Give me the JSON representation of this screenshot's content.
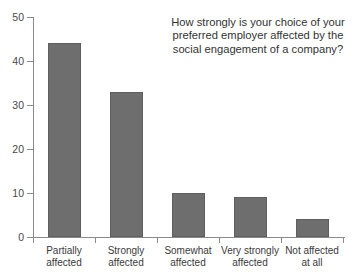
{
  "chart_data": {
    "type": "bar",
    "title": "",
    "subtitle": "",
    "annotation": "How strongly is your choice of your preferred employer affected by the social engagement of a company?",
    "categories": [
      "Partially affected",
      "Strongly affected",
      "Somewhat affected",
      "Very strongly affected",
      "Not affected at all"
    ],
    "category_lines": [
      [
        "Partially",
        "affected"
      ],
      [
        "Strongly",
        "affected"
      ],
      [
        "Somewhat",
        "affected"
      ],
      [
        "Very strongly",
        "affected"
      ],
      [
        "Not affected",
        "at all"
      ]
    ],
    "values": [
      44,
      33,
      10,
      9,
      4
    ],
    "xlabel": "",
    "ylabel": "",
    "ylim": [
      0,
      50
    ],
    "yticks": [
      0,
      10,
      20,
      30,
      40,
      50
    ],
    "ytick_labels": [
      "0",
      "10",
      "20",
      "30",
      "40",
      "50"
    ],
    "grid": false,
    "legend": "none",
    "bar_color": "#6e6e6e",
    "axis_color": "#8a8a8a",
    "background": "#ffffff"
  }
}
